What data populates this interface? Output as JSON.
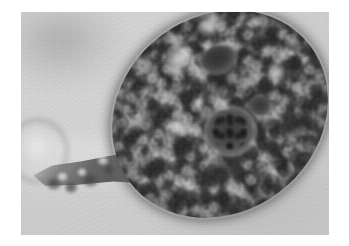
{
  "figure": {
    "kind": "photomicrograph",
    "modality": "brightfield light microscopy",
    "color_mode": "grayscale",
    "border": {
      "style": "white photographic print margin",
      "color": "#ffffff",
      "left_px": 21,
      "top_px": 12,
      "right_px": 20,
      "bottom_px": 11
    },
    "plate": {
      "width_px": 308,
      "height_px": 223,
      "background_color": "#d6d6d6",
      "background_description": "uniform pale gray mounting medium with fine film grain"
    }
  },
  "subject": {
    "name": "protozoan cell",
    "label": "amoeboid trophozoite",
    "description": "single ovoid cell with coarsely granular cytoplasm, tapering posterior uroid and several internal vacuoles",
    "body": {
      "shape": "ellipse",
      "orientation_deg": -37,
      "center_x_px": 199,
      "center_y_px": 102,
      "width_px": 226,
      "height_px": 196,
      "fill_color": "#6b6b6b",
      "rim_color": "#4a4a4a"
    },
    "uroid": {
      "label": "uroid / tapering tail",
      "description": "narrow granular projection extending to the lower left of the cell body",
      "color": "#585858"
    }
  },
  "organelles": [
    {
      "name": "nucleus",
      "label": "nucleus",
      "shape": "round",
      "center_x_px": 198,
      "center_y_px": 138,
      "diameter_px": 28,
      "color": "#3f3f3f",
      "note": "dark round body surrounded by a pale halo"
    },
    {
      "name": "vacuole-large",
      "label": "large vacuole",
      "shape": "oval",
      "center_x_px": 224,
      "center_y_px": 87,
      "width_px": 22,
      "height_px": 17,
      "color": "#353535"
    },
    {
      "name": "vacuole-small",
      "label": "small vacuole",
      "shape": "round",
      "center_x_px": 230,
      "center_y_px": 132,
      "diameter_px": 13,
      "color": "#3c3c3c"
    }
  ],
  "field_features": [
    {
      "name": "debris-ring",
      "label": "out-of-focus circular debris",
      "position": "left edge, partially clipped by print border",
      "color": "#9a9a9a"
    },
    {
      "name": "smudge-upper-left",
      "label": "faint dark smudge",
      "position": "upper left background",
      "color": "#c0c0c0"
    },
    {
      "name": "highlight-streak",
      "label": "bright diagonal highlight",
      "position": "left of cell, mid height",
      "color": "#e6e6e6"
    }
  ],
  "palette": {
    "paper_white": "#ffffff",
    "background_gray": "#d6d6d6",
    "cell_mid_gray": "#6b6b6b",
    "cell_dark_gray": "#3d3d3d",
    "organelle_black": "#2e2e2e",
    "highlight_white": "#efefef"
  },
  "text": {
    "has_text": false,
    "caption": "",
    "scale_bar": "",
    "annotations": []
  }
}
